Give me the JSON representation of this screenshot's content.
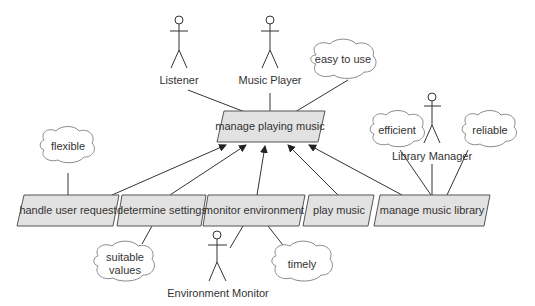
{
  "diagram": {
    "type": "goal-decomposition",
    "root_goal": {
      "label": "manage playing music"
    },
    "subgoals": [
      {
        "label": "handle user request"
      },
      {
        "label": "determine settings"
      },
      {
        "label": "monitor environment"
      },
      {
        "label": "play music"
      },
      {
        "label": "manage music library"
      }
    ],
    "actors": [
      {
        "label": "Listener"
      },
      {
        "label": "Music Player"
      },
      {
        "label": "Library Manager"
      },
      {
        "label": "Environment Monitor"
      }
    ],
    "qualities": [
      {
        "label": "easy to use"
      },
      {
        "label": "flexible"
      },
      {
        "label": "efficient"
      },
      {
        "label": "reliable"
      },
      {
        "label": "suitable",
        "label2": "values"
      },
      {
        "label": "timely"
      }
    ],
    "colors": {
      "goal_fill": "#e2e2e2",
      "goal_stroke": "#555555",
      "line": "#333333",
      "cloud_stroke": "#8a8a8a"
    }
  }
}
